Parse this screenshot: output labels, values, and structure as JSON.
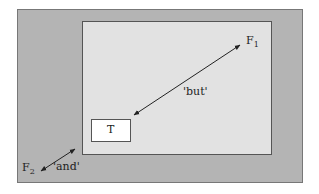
{
  "diagram": {
    "colors": {
      "outer_fill": "#b4b4b4",
      "inner_fill": "#e2e2e2",
      "box_fill": "#ffffff",
      "stroke": "#555555"
    },
    "box": {
      "label": "T"
    },
    "nodes": {
      "f1": {
        "main": "F",
        "sub": "1"
      },
      "f2": {
        "main": "F",
        "sub": "2"
      }
    },
    "edges": [
      {
        "from": "T",
        "to": "F1",
        "label": "'but'"
      },
      {
        "from": "F2",
        "to": "inner-region",
        "label": "'and'"
      }
    ]
  }
}
